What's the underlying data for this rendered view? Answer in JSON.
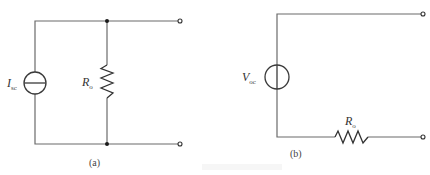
{
  "diagram": {
    "type": "circuit-schematic",
    "colors": {
      "wire": "#6b6b6b",
      "component": "#333333",
      "background": "#ffffff"
    },
    "circuit_a": {
      "caption": "(a)",
      "source": {
        "kind": "current-source",
        "symbol": "I",
        "subscript": "sc"
      },
      "resistor": {
        "symbol": "R",
        "subscript": "o",
        "connection": "parallel"
      },
      "terminals": 2
    },
    "circuit_b": {
      "caption": "(b)",
      "source": {
        "kind": "voltage-source",
        "symbol": "V",
        "subscript": "oc"
      },
      "resistor": {
        "symbol": "R",
        "subscript": "o",
        "connection": "series"
      },
      "terminals": 2
    },
    "figure_caption": ""
  }
}
